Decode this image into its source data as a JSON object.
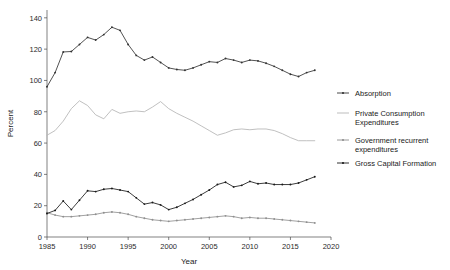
{
  "chart_data": {
    "type": "line",
    "title": "",
    "xlabel": "Year",
    "ylabel": "Percent",
    "xlim": [
      1985,
      2020
    ],
    "ylim": [
      0,
      145
    ],
    "xticks": [
      1985,
      1990,
      1995,
      2000,
      2005,
      2010,
      2015,
      2020
    ],
    "yticks": [
      0,
      20,
      40,
      60,
      80,
      100,
      120,
      140
    ],
    "grid": false,
    "legend_position": "right",
    "x": [
      1985,
      1986,
      1987,
      1988,
      1989,
      1990,
      1991,
      1992,
      1993,
      1994,
      1995,
      1996,
      1997,
      1998,
      1999,
      2000,
      2001,
      2002,
      2003,
      2004,
      2005,
      2006,
      2007,
      2008,
      2009,
      2010,
      2011,
      2012,
      2013,
      2014,
      2015,
      2016,
      2017,
      2018
    ],
    "series": [
      {
        "name": "Absorption",
        "color": "#333333",
        "marker": true,
        "values": [
          96.0,
          105.0,
          118.2,
          118.5,
          123.0,
          127.5,
          125.8,
          129.3,
          134.0,
          132.0,
          123.0,
          116.0,
          113.0,
          115.0,
          111.5,
          108.0,
          107.0,
          106.5,
          108.0,
          110.0,
          112.0,
          111.5,
          114.0,
          113.0,
          111.5,
          113.0,
          112.5,
          111.0,
          109.0,
          106.5,
          104.0,
          102.5,
          105.0,
          106.5
        ]
      },
      {
        "name": "Private Consumption Expenditures",
        "color": "#b5b5b5",
        "marker": false,
        "values": [
          65.0,
          68.0,
          74.0,
          82.0,
          87.0,
          84.0,
          78.0,
          75.5,
          81.5,
          79.0,
          80.0,
          80.5,
          80.0,
          83.0,
          86.5,
          82.0,
          79.0,
          76.5,
          74.0,
          71.0,
          68.0,
          65.0,
          66.5,
          68.5,
          69.0,
          68.5,
          69.0,
          69.0,
          68.0,
          66.0,
          63.5,
          61.5,
          61.5,
          61.5
        ]
      },
      {
        "name": "Government recurrent expenditures",
        "color": "#8f8f8f",
        "marker": true,
        "values": [
          15.5,
          14.0,
          13.0,
          13.0,
          13.5,
          14.0,
          14.5,
          15.5,
          16.0,
          15.5,
          14.5,
          13.0,
          12.0,
          11.0,
          10.5,
          10.0,
          10.5,
          11.0,
          11.5,
          12.0,
          12.5,
          13.0,
          13.5,
          13.0,
          12.0,
          12.5,
          12.0,
          12.0,
          11.5,
          11.0,
          10.5,
          10.0,
          9.5,
          9.0
        ]
      },
      {
        "name": "Gross Capital Formation",
        "color": "#1a1a1a",
        "marker": true,
        "values": [
          15.0,
          17.0,
          23.0,
          17.5,
          23.5,
          29.5,
          29.0,
          30.5,
          31.0,
          30.0,
          29.0,
          25.0,
          21.0,
          22.0,
          20.5,
          17.5,
          19.0,
          21.5,
          24.0,
          27.0,
          30.0,
          33.5,
          35.0,
          32.0,
          33.0,
          35.5,
          34.0,
          34.5,
          33.5,
          33.5,
          33.5,
          34.5,
          36.5,
          38.5
        ]
      }
    ]
  },
  "legend": {
    "items": [
      {
        "label": "Absorption"
      },
      {
        "label": "Private Consumption",
        "label2": "Expenditures"
      },
      {
        "label": "Government recurrent",
        "label2": "expenditures"
      },
      {
        "label": "Gross Capital Formation"
      }
    ]
  }
}
